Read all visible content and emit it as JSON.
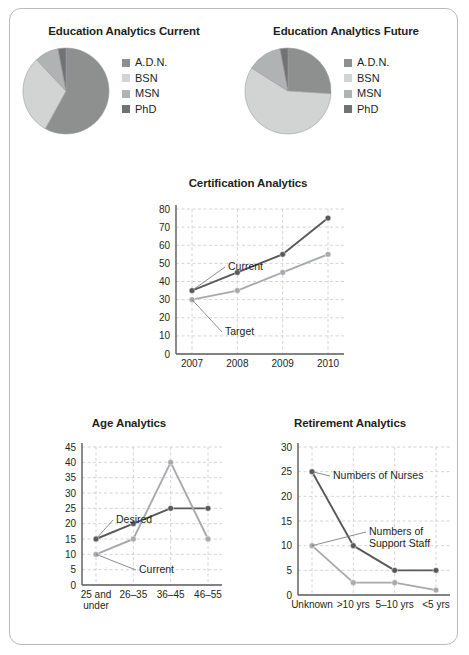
{
  "colors": {
    "adn": "#8e9090",
    "bsn": "#d2d4d4",
    "msn": "#b0b3b3",
    "phd": "#6f7374",
    "dark_series": "#58595b",
    "light_series": "#a7a9ac",
    "grid": "#c8c9cb",
    "axis": "#58595b",
    "text": "#231f20",
    "border": "#b9b9b9"
  },
  "pies": [
    {
      "title": "Education Analytics Current",
      "legend": [
        {
          "label": "A.D.N.",
          "color": "#8e9090"
        },
        {
          "label": "BSN",
          "color": "#d2d4d4"
        },
        {
          "label": "MSN",
          "color": "#b0b3b3"
        },
        {
          "label": "PhD",
          "color": "#6f7374"
        }
      ],
      "chart_data": {
        "type": "pie",
        "title": "Education Analytics Current",
        "labels": [
          "A.D.N.",
          "BSN",
          "MSN",
          "PhD"
        ],
        "values": [
          58,
          30,
          9,
          3
        ],
        "colors": [
          "#8e9090",
          "#d2d4d4",
          "#b0b3b3",
          "#6f7374"
        ],
        "legend_position": "right"
      }
    },
    {
      "title": "Education Analytics Future",
      "legend": [
        {
          "label": "A.D.N.",
          "color": "#8e9090"
        },
        {
          "label": "BSN",
          "color": "#d2d4d4"
        },
        {
          "label": "MSN",
          "color": "#b0b3b3"
        },
        {
          "label": "PhD",
          "color": "#6f7374"
        }
      ],
      "chart_data": {
        "type": "pie",
        "title": "Education Analytics Future",
        "labels": [
          "A.D.N.",
          "BSN",
          "MSN",
          "PhD"
        ],
        "values": [
          26,
          58,
          13,
          3
        ],
        "colors": [
          "#8e9090",
          "#d2d4d4",
          "#b0b3b3",
          "#6f7374"
        ],
        "legend_position": "right"
      }
    }
  ],
  "cert": {
    "title": "Certification Analytics",
    "annotations": [
      {
        "text": "Current"
      },
      {
        "text": "Target"
      }
    ],
    "chart_data": {
      "type": "line",
      "title": "Certification Analytics",
      "xlabel": "",
      "ylabel": "",
      "categories": [
        "2007",
        "2008",
        "2009",
        "2010"
      ],
      "yticks": [
        0,
        10,
        20,
        30,
        40,
        50,
        60,
        70,
        80
      ],
      "ylim": [
        0,
        80
      ],
      "grid": true,
      "series": [
        {
          "name": "Current",
          "values": [
            35,
            45,
            55,
            75
          ],
          "color": "#58595b"
        },
        {
          "name": "Target",
          "values": [
            30,
            35,
            45,
            55
          ],
          "color": "#a7a9ac"
        }
      ]
    }
  },
  "age": {
    "title": "Age Analytics",
    "annotations": [
      {
        "text": "Desired"
      },
      {
        "text": "Current"
      }
    ],
    "chart_data": {
      "type": "line",
      "title": "Age Analytics",
      "xlabel": "",
      "ylabel": "",
      "categories": [
        "25 and under",
        "26–35",
        "36–45",
        "46–55"
      ],
      "yticks": [
        0,
        5,
        10,
        15,
        20,
        25,
        30,
        35,
        40,
        45
      ],
      "ylim": [
        0,
        45
      ],
      "grid": true,
      "series": [
        {
          "name": "Desired",
          "values": [
            15,
            20,
            25,
            25
          ],
          "color": "#58595b"
        },
        {
          "name": "Current",
          "values": [
            10,
            15,
            40,
            15
          ],
          "color": "#a7a9ac"
        }
      ]
    }
  },
  "ret": {
    "title": "Retirement Analytics",
    "annotations": [
      {
        "text": "Numbers of Nurses"
      },
      {
        "text": "Numbers of"
      },
      {
        "text": "Support Staff"
      }
    ],
    "chart_data": {
      "type": "line",
      "title": "Retirement Analytics",
      "xlabel": "",
      "ylabel": "",
      "categories": [
        "Unknown",
        ">10 yrs",
        "5–10 yrs",
        "<5 yrs"
      ],
      "yticks": [
        0,
        5,
        10,
        15,
        20,
        25,
        30
      ],
      "ylim": [
        0,
        30
      ],
      "grid": true,
      "series": [
        {
          "name": "Numbers of Nurses",
          "values": [
            25,
            10,
            5,
            5
          ],
          "color": "#58595b"
        },
        {
          "name": "Numbers of Support Staff",
          "values": [
            10,
            2.5,
            2.5,
            1
          ],
          "color": "#a7a9ac"
        }
      ]
    }
  }
}
